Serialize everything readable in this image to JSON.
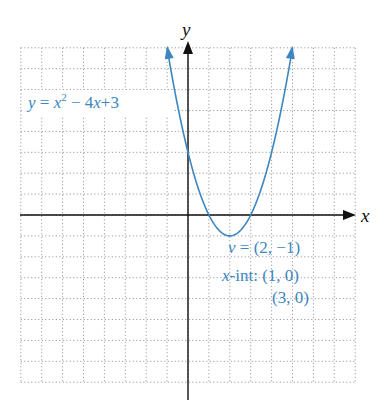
{
  "chart_data": {
    "type": "line",
    "title": "",
    "xlabel": "x",
    "ylabel": "y",
    "xlim": [
      -8,
      8
    ],
    "ylim": [
      -8,
      8
    ],
    "grid": true,
    "grid_style": "dotted",
    "series": [
      {
        "name": "y = x^2 - 4x + 3",
        "function": "x^2 - 4x + 3",
        "x": [
          -1,
          0,
          1,
          2,
          3,
          4,
          5
        ],
        "values": [
          8,
          3,
          0,
          -1,
          0,
          3,
          8
        ],
        "color": "#3d86c0",
        "arrows_at_ends": true
      }
    ],
    "annotations": [
      {
        "text": "y = x² − 4x + 3",
        "position": "upper-left"
      },
      {
        "text": "v = (2, −1)",
        "position": "below vertex, right"
      },
      {
        "text": "x-int: (1, 0)",
        "position": "right"
      },
      {
        "text": "(3, 0)",
        "position": "right"
      }
    ]
  },
  "labels": {
    "x_axis": "x",
    "y_axis": "y",
    "equation_lhs": "y",
    "equation_eq": " = ",
    "equation_x": "x",
    "equation_exp": "2",
    "equation_rest1": " − 4",
    "equation_x2": "x",
    "equation_rest2": "+3",
    "vertex_v": "v",
    "vertex_rest": " = (2, −1)",
    "xint_x": "x",
    "xint_rest": "-int: (1, 0)",
    "xint_second": "(3, 0)"
  },
  "colors": {
    "curve": "#3d86c0",
    "axes": "#111111",
    "grid": "#8a8a8a"
  }
}
